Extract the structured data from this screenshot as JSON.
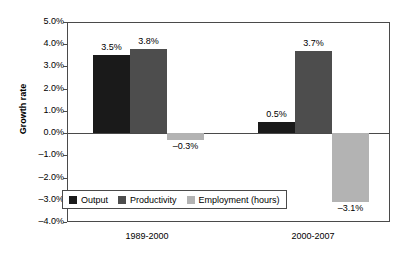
{
  "chart_data": {
    "type": "bar",
    "title": "",
    "xlabel": "",
    "ylabel": "Growth rate",
    "categories": [
      "1989-2000",
      "2000-2007"
    ],
    "series": [
      {
        "name": "Output",
        "color": "#1a1a1a",
        "values": [
          3.5,
          0.5
        ],
        "labels": [
          "3.5%",
          "0.5%"
        ]
      },
      {
        "name": "Productivity",
        "color": "#4d4d4d",
        "values": [
          3.8,
          3.7
        ],
        "labels": [
          "3.8%",
          "3.7%"
        ]
      },
      {
        "name": "Employment (hours)",
        "color": "#b3b3b3",
        "values": [
          -0.3,
          -3.1
        ],
        "labels": [
          "–0.3%",
          "–3.1%"
        ]
      }
    ],
    "ylim": [
      -4.0,
      5.0
    ],
    "ytick_labels": [
      "5.0%",
      "4.0%",
      "3.0%",
      "2.0%",
      "1.0%",
      "0.0%",
      "–1.0%",
      "–2.0%",
      "–3.0%",
      "–4.0%"
    ],
    "ytick_values": [
      5.0,
      4.0,
      3.0,
      2.0,
      1.0,
      0.0,
      -1.0,
      -2.0,
      -3.0,
      -4.0
    ],
    "grid": false,
    "legend_position": "inside-bottom-left",
    "units": "percent",
    "value_format": "0.0%"
  },
  "legend": {
    "entries": [
      {
        "label": "Output",
        "color": "#1a1a1a"
      },
      {
        "label": "Productivity",
        "color": "#4d4d4d"
      },
      {
        "label": "Employment (hours)",
        "color": "#b3b3b3"
      }
    ]
  },
  "axis": {
    "y_title": "Growth rate"
  }
}
